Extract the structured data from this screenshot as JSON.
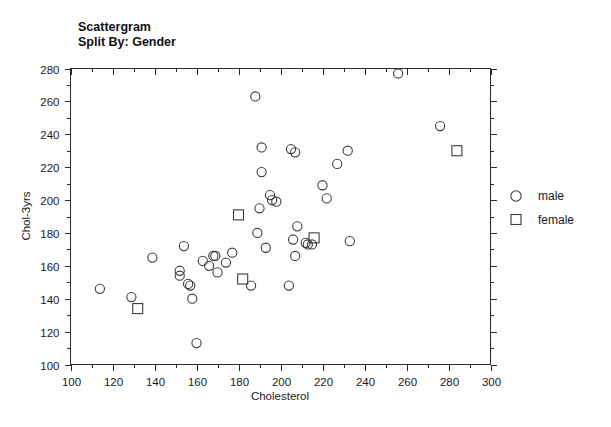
{
  "chart_data": {
    "type": "scatter",
    "title": "Scattergram",
    "subtitle": "Split By: Gender",
    "xlabel": "Cholesterol",
    "ylabel": "Chol-3yrs",
    "xlim": [
      100,
      300
    ],
    "ylim": [
      100,
      280
    ],
    "x_major_step": 20,
    "x_minor_step": 10,
    "y_major_step": 20,
    "y_minor_step": 10,
    "grid": false,
    "legend_position": "right",
    "x_ticks": [
      100,
      120,
      140,
      160,
      180,
      200,
      220,
      240,
      260,
      280,
      300
    ],
    "y_ticks": [
      100,
      120,
      140,
      160,
      180,
      200,
      220,
      240,
      260,
      280
    ],
    "series": [
      {
        "name": "male",
        "marker": "circle",
        "color": "#3a3a3a",
        "points": [
          [
            114,
            146
          ],
          [
            129,
            141
          ],
          [
            139,
            165
          ],
          [
            152,
            157
          ],
          [
            152,
            154
          ],
          [
            154,
            172
          ],
          [
            156,
            149
          ],
          [
            157,
            148
          ],
          [
            158,
            140
          ],
          [
            160,
            113
          ],
          [
            163,
            163
          ],
          [
            166,
            160
          ],
          [
            168,
            166
          ],
          [
            169,
            166
          ],
          [
            170,
            156
          ],
          [
            174,
            162
          ],
          [
            177,
            168
          ],
          [
            186,
            148
          ],
          [
            188,
            263
          ],
          [
            189,
            180
          ],
          [
            190,
            195
          ],
          [
            191,
            217
          ],
          [
            191,
            232
          ],
          [
            193,
            171
          ],
          [
            195,
            203
          ],
          [
            196,
            200
          ],
          [
            198,
            199
          ],
          [
            204,
            148
          ],
          [
            205,
            231
          ],
          [
            206,
            176
          ],
          [
            207,
            229
          ],
          [
            207,
            166
          ],
          [
            208,
            184
          ],
          [
            212,
            174
          ],
          [
            213,
            173
          ],
          [
            215,
            173
          ],
          [
            220,
            209
          ],
          [
            222,
            201
          ],
          [
            227,
            222
          ],
          [
            232,
            230
          ],
          [
            233,
            175
          ],
          [
            256,
            277
          ],
          [
            276,
            245
          ]
        ]
      },
      {
        "name": "female",
        "marker": "square",
        "color": "#3a3a3a",
        "points": [
          [
            132,
            134
          ],
          [
            180,
            191
          ],
          [
            182,
            152
          ],
          [
            216,
            177
          ],
          [
            284,
            230
          ]
        ]
      }
    ],
    "legend": [
      {
        "label": "male",
        "marker": "circle"
      },
      {
        "label": "female",
        "marker": "square"
      }
    ]
  }
}
